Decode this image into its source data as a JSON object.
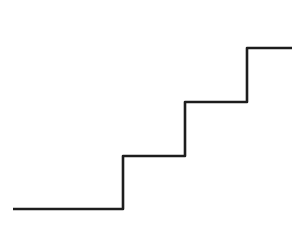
{
  "canvas": {
    "width": 292,
    "height": 235,
    "background_color": "#ffffff",
    "title": "Staircase Line Drawing"
  },
  "drawing": {
    "name": "staircase-polyline",
    "stroke_color": "#1d1d1d",
    "stroke_width": 2.6,
    "stroke_linejoin": "round",
    "stroke_linecap": "butt",
    "step_count": 3,
    "tread_length": 62,
    "riser_height": 54,
    "points": [
      [
        13,
        209
      ],
      [
        123,
        209
      ],
      [
        123,
        156
      ],
      [
        185,
        156
      ],
      [
        185,
        102
      ],
      [
        247,
        102
      ],
      [
        247,
        48
      ],
      [
        292,
        48
      ]
    ],
    "path_d": "M 13 209 L 123 209 L 123 156 L 185 156 L 185 102 L 247 102 L 247 48 L 292 48",
    "segments": [
      {
        "name": "base-tread",
        "orientation": "horizontal",
        "from": [
          13,
          209
        ],
        "to": [
          123,
          209
        ],
        "length": 110
      },
      {
        "name": "riser-1",
        "orientation": "vertical",
        "from": [
          123,
          209
        ],
        "to": [
          123,
          156
        ],
        "length": 53
      },
      {
        "name": "tread-1",
        "orientation": "horizontal",
        "from": [
          123,
          156
        ],
        "to": [
          185,
          156
        ],
        "length": 62
      },
      {
        "name": "riser-2",
        "orientation": "vertical",
        "from": [
          185,
          156
        ],
        "to": [
          185,
          102
        ],
        "length": 54
      },
      {
        "name": "tread-2",
        "orientation": "horizontal",
        "from": [
          185,
          102
        ],
        "to": [
          247,
          102
        ],
        "length": 62
      },
      {
        "name": "riser-3",
        "orientation": "vertical",
        "from": [
          247,
          102
        ],
        "to": [
          247,
          48
        ],
        "length": 54
      },
      {
        "name": "top-tread",
        "orientation": "horizontal",
        "from": [
          247,
          48
        ],
        "to": [
          292,
          48
        ],
        "length": 45
      }
    ]
  }
}
